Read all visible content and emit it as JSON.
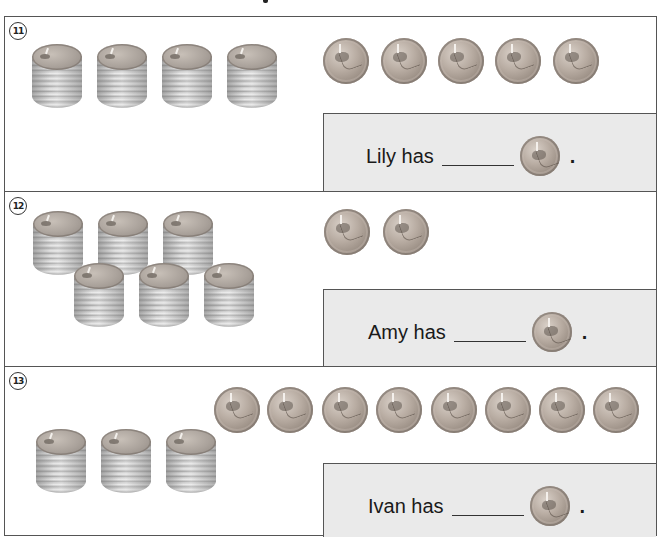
{
  "worksheet": {
    "sections": [
      {
        "number": "11",
        "number_glyph": "⑪",
        "stacks_count": 4,
        "loose_coins_count": 5,
        "answer": {
          "name": "Lily",
          "label": "Lily has",
          "blank": "",
          "coin": "penny-icon",
          "end": "."
        }
      },
      {
        "number": "12",
        "number_glyph": "⑫",
        "stacks_count": 6,
        "loose_coins_count": 2,
        "answer": {
          "name": "Amy",
          "label": "Amy has",
          "blank": "",
          "coin": "penny-icon",
          "end": "."
        }
      },
      {
        "number": "13",
        "number_glyph": "⑬",
        "stacks_count": 3,
        "loose_coins_count": 8,
        "answer": {
          "name": "Ivan",
          "label": "Ivan has",
          "blank": "",
          "coin": "penny-icon",
          "end": "."
        }
      }
    ]
  },
  "colors": {
    "border": "#555555",
    "answer_box_bg": "#eaeaea",
    "text": "#1a1a1a",
    "coin_copper_gray": "#b8aca2",
    "stack_silver": "#c9c9c9"
  }
}
